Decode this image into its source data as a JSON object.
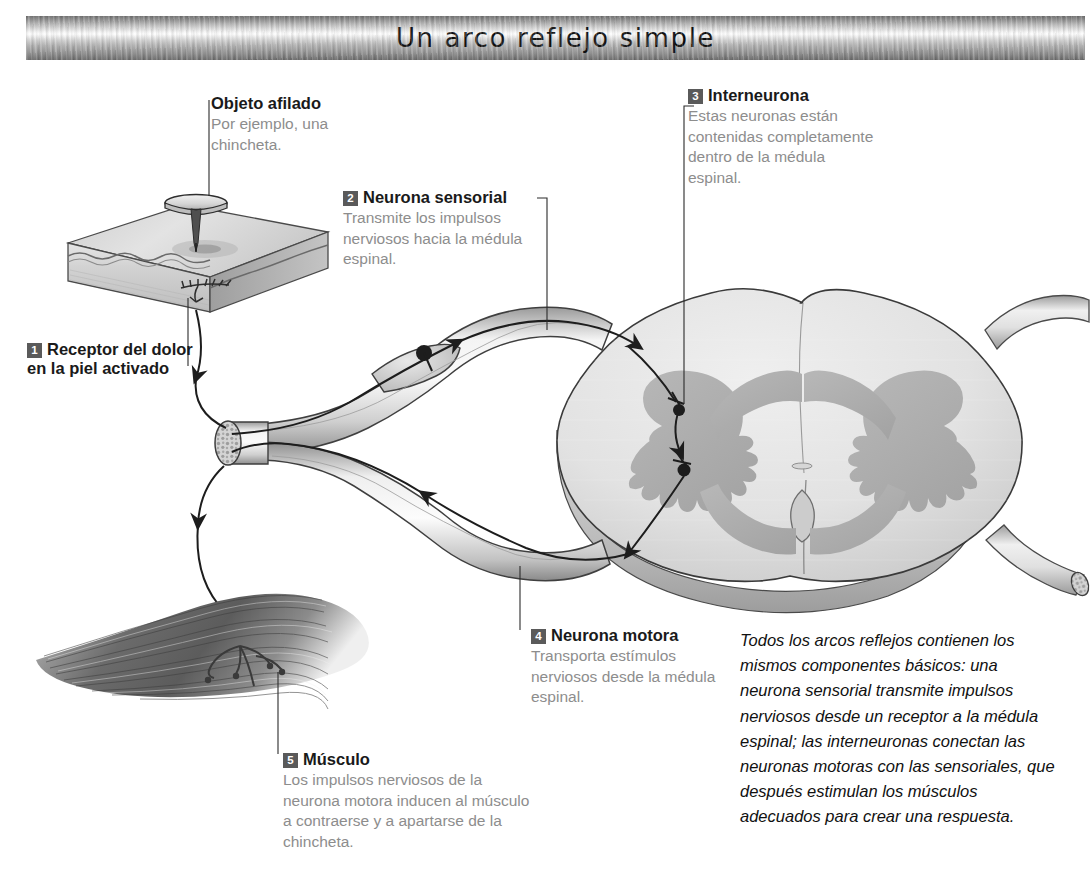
{
  "banner": {
    "title": "Un arco reflejo simple"
  },
  "callouts": [
    {
      "number": "1",
      "heading": "Receptor del dolor en la piel activado",
      "body": ""
    },
    {
      "number": "2",
      "heading": "Neurona sensorial",
      "body": "Transmite los impulsos nerviosos hacia la médula espinal."
    },
    {
      "number": "3",
      "heading": "Interneurona",
      "body": "Estas neuronas están contenidas completamente dentro de la médula espinal."
    },
    {
      "number": "4",
      "heading": "Neurona motora",
      "body": "Transporta estímulos nerviosos desde la médula espinal."
    },
    {
      "number": "5",
      "heading": "Músculo",
      "body": "Los impulsos nerviosos de la neurona motora inducen al músculo a contraerse y a apartarse de la chincheta."
    }
  ],
  "sharp_object": {
    "heading": "Objeto afilado",
    "body": "Por ejemplo, una chincheta."
  },
  "summary": "Todos los arcos reflejos contienen los mismos componentes básicos: una neurona sensorial transmite impulsos nerviosos desde un receptor a la médula espinal; las interneuronas conectan las neuronas motoras con las sensoriales, que después estimulan los músculos adecuados para crear una respuesta.",
  "colors": {
    "heading_text": "#1a1a1a",
    "body_text": "#8d8d8d",
    "badge_fill": "#5a5a5a",
    "badge_text": "#ffffff",
    "leader_line": "#2b2b2b",
    "cord_outline": "#3a3a3a",
    "white_matter": "#e2e2e2",
    "gray_matter": "#b0b0b0",
    "nerve_fill": "#e8e8e8",
    "muscle_dark": "#5e5e5e",
    "skin_top": "#d6d6d6",
    "background": "#ffffff"
  },
  "figure": {
    "type": "anatomical-diagram",
    "parts": [
      "thumbtack",
      "skin-block",
      "pain-receptor-nerve-endings",
      "sensory-neuron-axon",
      "dorsal-root-ganglion",
      "spinal-nerve",
      "spinal-cord-cross-section",
      "gray-matter-butterfly",
      "interneuron",
      "motor-neuron-axon",
      "muscle"
    ],
    "signal_flow": [
      "skin receptor",
      "sensory neuron",
      "dorsal root ganglion",
      "spinal cord gray matter",
      "interneuron",
      "motor neuron",
      "muscle"
    ]
  }
}
